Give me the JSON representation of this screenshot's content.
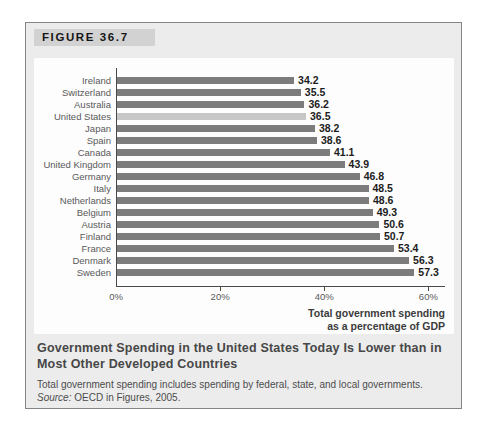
{
  "figure": {
    "label": "FIGURE 36.7"
  },
  "chart_data": {
    "type": "bar",
    "orientation": "horizontal",
    "categories": [
      "Ireland",
      "Switzerland",
      "Australia",
      "United States",
      "Japan",
      "Spain",
      "Canada",
      "United Kingdom",
      "Germany",
      "Italy",
      "Netherlands",
      "Belgium",
      "Austria",
      "Finland",
      "France",
      "Denmark",
      "Sweden"
    ],
    "values": [
      34.2,
      35.5,
      36.2,
      36.5,
      38.2,
      38.6,
      41.1,
      43.9,
      46.8,
      48.5,
      48.6,
      49.3,
      50.6,
      50.7,
      53.4,
      56.3,
      57.3
    ],
    "highlight_category": "United States",
    "bar_color": "#7c7c7c",
    "highlight_color": "#c7c7c7",
    "xlabel": "Total government spending as a percentage of GDP",
    "xlabel_lines": [
      "Total government spending",
      "as a percentage of GDP"
    ],
    "x_ticks": [
      {
        "value": 0,
        "label": "0%"
      },
      {
        "value": 20,
        "label": "20%"
      },
      {
        "value": 40,
        "label": "40%"
      },
      {
        "value": 60,
        "label": "60%"
      }
    ],
    "xlim": [
      0,
      63
    ],
    "grid": false,
    "legend": false
  },
  "caption": {
    "title": "Government Spending in the United States Today Is Lower than in Most Other Developed Countries",
    "note": "Total government spending includes spending by federal, state, and local governments.",
    "source_label": "Source:",
    "source_rest": " OECD in Figures, 2005."
  }
}
